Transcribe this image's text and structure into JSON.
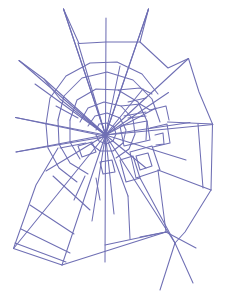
{
  "figure": {
    "type": "line-drawing",
    "width": 231,
    "height": 296,
    "background_color": "#ffffff",
    "stroke_color": "#6f6fb4",
    "stroke_width": 1.05,
    "hub": {
      "x": 105.5,
      "y": 135.0
    }
  },
  "chart_data": {
    "type": "line",
    "subtitle": "",
    "xlabel": "",
    "ylabel": "",
    "grid": false,
    "legend_position": "none",
    "xlim": [
      0,
      231
    ],
    "ylim": [
      0,
      296
    ],
    "annotations": [],
    "stroke_color": "#6f6fb4",
    "background_color": "#ffffff",
    "hub": {
      "x": 105.5,
      "y": 135.0
    },
    "radials": [
      {
        "name": "radial-n-long",
        "points": [
          [
            105.5,
            135.0
          ],
          [
            63.5,
            9.0
          ]
        ]
      },
      {
        "name": "radial-nne",
        "points": [
          [
            105.5,
            135.0
          ],
          [
            106.0,
            18.0
          ]
        ]
      },
      {
        "name": "radial-ne-long",
        "points": [
          [
            105.5,
            135.0
          ],
          [
            148.5,
            9.0
          ]
        ]
      },
      {
        "name": "radial-ne-frame",
        "points": [
          [
            105.5,
            135.0
          ],
          [
            188.5,
            58.5
          ]
        ]
      },
      {
        "name": "radial-ene",
        "points": [
          [
            105.5,
            135.0
          ],
          [
            168.5,
            92.5
          ]
        ]
      },
      {
        "name": "radial-e-upper",
        "points": [
          [
            105.5,
            135.0
          ],
          [
            190.0,
            122.5
          ]
        ]
      },
      {
        "name": "radial-e",
        "points": [
          [
            105.5,
            135.0
          ],
          [
            213.0,
            124.5
          ]
        ]
      },
      {
        "name": "radial-ese",
        "points": [
          [
            105.5,
            135.0
          ],
          [
            186.0,
            160.0
          ]
        ]
      },
      {
        "name": "radial-se",
        "points": [
          [
            105.5,
            135.0
          ],
          [
            175.0,
            243.0
          ]
        ]
      },
      {
        "name": "radial-s",
        "points": [
          [
            105.5,
            135.0
          ],
          [
            105.0,
            262.0
          ]
        ]
      },
      {
        "name": "radial-ssw",
        "points": [
          [
            105.5,
            135.0
          ],
          [
            62.0,
            265.0
          ]
        ]
      },
      {
        "name": "radial-sw",
        "points": [
          [
            105.5,
            135.0
          ],
          [
            13.5,
            248.5
          ]
        ]
      },
      {
        "name": "radial-wsw",
        "points": [
          [
            105.5,
            135.0
          ],
          [
            16.0,
            152.0
          ]
        ]
      },
      {
        "name": "radial-w",
        "points": [
          [
            105.5,
            135.0
          ],
          [
            15.5,
            117.5
          ]
        ]
      },
      {
        "name": "radial-wnw",
        "points": [
          [
            105.5,
            135.0
          ],
          [
            35.0,
            84.0
          ]
        ]
      },
      {
        "name": "radial-nw",
        "points": [
          [
            105.5,
            135.0
          ],
          [
            19.0,
            60.5
          ]
        ]
      },
      {
        "name": "radial-nnw",
        "points": [
          [
            105.5,
            135.0
          ],
          [
            78.0,
            43.0
          ]
        ]
      },
      {
        "name": "radial-inner-sse",
        "points": [
          [
            105.5,
            135.0
          ],
          [
            128.0,
            196.0
          ]
        ]
      },
      {
        "name": "radial-inner-ese2",
        "points": [
          [
            105.5,
            135.0
          ],
          [
            146.0,
            168.0
          ]
        ]
      },
      {
        "name": "radial-inner-nne2",
        "points": [
          [
            105.5,
            135.0
          ],
          [
            120.0,
            66.0
          ]
        ]
      },
      {
        "name": "radial-inner-s2",
        "points": [
          [
            105.5,
            135.0
          ],
          [
            92.0,
            221.0
          ]
        ]
      }
    ],
    "capture_spiral_rings": [
      {
        "name": "ring-1",
        "radius": 11
      },
      {
        "name": "ring-2",
        "radius": 20
      },
      {
        "name": "ring-3",
        "radius": 30
      },
      {
        "name": "ring-4",
        "radius": 43
      },
      {
        "name": "ring-5",
        "radius": 57
      },
      {
        "name": "ring-6",
        "radius": 72
      }
    ],
    "frame_anchor_points": [
      {
        "name": "anchor-top-left",
        "x": 63.5,
        "y": 9.0
      },
      {
        "name": "anchor-top-right",
        "x": 148.5,
        "y": 9.0
      },
      {
        "name": "anchor-upper-right",
        "x": 188.5,
        "y": 58.5
      },
      {
        "name": "anchor-right",
        "x": 213.0,
        "y": 124.5
      },
      {
        "name": "anchor-lower-right",
        "x": 211.0,
        "y": 190.0
      },
      {
        "name": "anchor-bottom-right",
        "x": 193.0,
        "y": 283.0
      },
      {
        "name": "anchor-bottom",
        "x": 175.0,
        "y": 243.0
      },
      {
        "name": "anchor-bottom-left",
        "x": 13.5,
        "y": 248.5
      },
      {
        "name": "anchor-left",
        "x": 15.5,
        "y": 117.5
      },
      {
        "name": "anchor-upper-left",
        "x": 19.0,
        "y": 60.5
      }
    ]
  }
}
